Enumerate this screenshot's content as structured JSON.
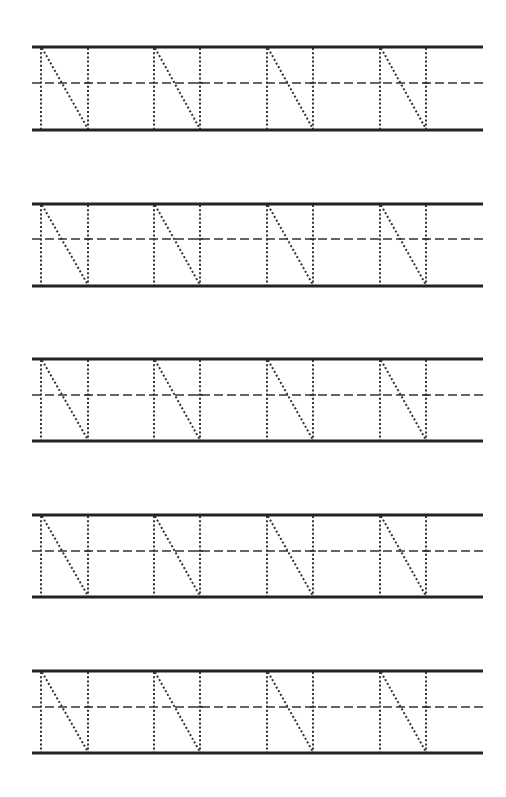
{
  "worksheet": {
    "title": "",
    "letter": "N",
    "line_color": "#222222",
    "guide_color": "#333333",
    "line_left": 32,
    "line_right": 483,
    "letter_height": 83,
    "letters_per_row": 4,
    "letter_positions": [
      {
        "left": 41,
        "right": 88
      },
      {
        "left": 154,
        "right": 200
      },
      {
        "left": 267,
        "right": 313
      },
      {
        "left": 380,
        "right": 426
      }
    ],
    "rows": [
      {
        "top": 47,
        "mid": 83,
        "base": 130
      },
      {
        "top": 204,
        "mid": 239,
        "base": 286
      },
      {
        "top": 359,
        "mid": 395,
        "base": 441
      },
      {
        "top": 515,
        "mid": 551,
        "base": 597
      },
      {
        "top": 671,
        "mid": 707,
        "base": 753
      }
    ]
  }
}
